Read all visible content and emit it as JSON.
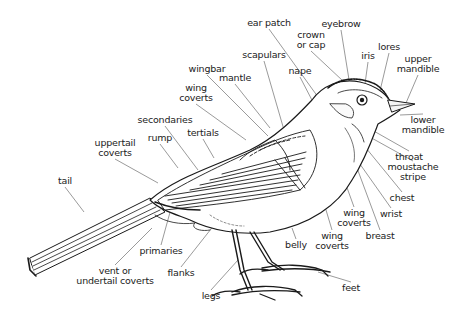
{
  "colors": {
    "ink": "#1a1a1a",
    "leader": "#555555",
    "background": "#ffffff"
  },
  "labels": [
    {
      "id": "ear_patch",
      "text": "ear patch",
      "x": 269,
      "y": 23,
      "lx": 318,
      "ly": 97
    },
    {
      "id": "eyebrow",
      "text": "eyebrow",
      "x": 341,
      "y": 24,
      "lx": 351,
      "ly": 92
    },
    {
      "id": "crown",
      "text": "crown\nor cap",
      "x": 311,
      "y": 40,
      "lx": 343,
      "ly": 81
    },
    {
      "id": "iris",
      "text": "iris",
      "x": 368,
      "y": 56,
      "lx": 364,
      "ly": 91
    },
    {
      "id": "lores",
      "text": "lores",
      "x": 389,
      "y": 47,
      "lx": 379,
      "ly": 95
    },
    {
      "id": "upper_mandible",
      "text": "upper\nmandible",
      "x": 418,
      "y": 64,
      "lx": 406,
      "ly": 103
    },
    {
      "id": "scapulars",
      "text": "scapulars",
      "x": 264,
      "y": 55,
      "lx": 284,
      "ly": 130
    },
    {
      "id": "nape",
      "text": "nape",
      "x": 300,
      "y": 71,
      "lx": 314,
      "ly": 104
    },
    {
      "id": "wingbar",
      "text": "wingbar",
      "x": 207,
      "y": 69,
      "lx": 268,
      "ly": 136
    },
    {
      "id": "mantle",
      "text": "mantle",
      "x": 235,
      "y": 78,
      "lx": 270,
      "ly": 128
    },
    {
      "id": "wing_coverts_upper",
      "text": "wing\ncoverts",
      "x": 196,
      "y": 93,
      "lx": 246,
      "ly": 140
    },
    {
      "id": "lower_mandible",
      "text": "lower\nmandible",
      "x": 423,
      "y": 125,
      "lx": 400,
      "ly": 115
    },
    {
      "id": "secondaries",
      "text": "secondaries",
      "x": 165,
      "y": 120,
      "lx": 198,
      "ly": 170
    },
    {
      "id": "tertials",
      "text": "tertials",
      "x": 203,
      "y": 133,
      "lx": 214,
      "ly": 158
    },
    {
      "id": "rump",
      "text": "rump",
      "x": 160,
      "y": 138,
      "lx": 178,
      "ly": 168
    },
    {
      "id": "uppertail_coverts",
      "text": "uppertail\ncoverts",
      "x": 115,
      "y": 148,
      "lx": 158,
      "ly": 183
    },
    {
      "id": "throat",
      "text": "throat",
      "x": 409,
      "y": 157,
      "lx": 372,
      "ly": 130
    },
    {
      "id": "moustache_stripe",
      "text": "moustache\nstripe",
      "x": 413,
      "y": 172,
      "lx": 368,
      "ly": 136
    },
    {
      "id": "tail",
      "text": "tail",
      "x": 65,
      "y": 181,
      "lx": 84,
      "ly": 212
    },
    {
      "id": "chest",
      "text": "chest",
      "x": 402,
      "y": 198,
      "lx": 366,
      "ly": 148
    },
    {
      "id": "wrist",
      "text": "wrist",
      "x": 391,
      "y": 214,
      "lx": 350,
      "ly": 150
    },
    {
      "id": "wing_coverts_mid",
      "text": "wing\ncoverts",
      "x": 354,
      "y": 218,
      "lx": 337,
      "ly": 160
    },
    {
      "id": "breast",
      "text": "breast",
      "x": 380,
      "y": 236,
      "lx": 357,
      "ly": 168
    },
    {
      "id": "wing_coverts_low",
      "text": "wing\ncoverts",
      "x": 332,
      "y": 241,
      "lx": 314,
      "ly": 170
    },
    {
      "id": "belly",
      "text": "belly",
      "x": 296,
      "y": 245,
      "lx": 292,
      "ly": 228
    },
    {
      "id": "primaries",
      "text": "primaries",
      "x": 161,
      "y": 251,
      "lx": 172,
      "ly": 205
    },
    {
      "id": "flanks",
      "text": "flanks",
      "x": 181,
      "y": 273,
      "lx": 226,
      "ly": 210
    },
    {
      "id": "vent",
      "text": "vent or\nundertail coverts",
      "x": 115,
      "y": 276,
      "lx": 152,
      "ly": 228
    },
    {
      "id": "feet",
      "text": "feet",
      "x": 351,
      "y": 288,
      "lx": 318,
      "ly": 272
    },
    {
      "id": "legs",
      "text": "legs",
      "x": 211,
      "y": 296,
      "lx": 238,
      "ly": 260
    }
  ]
}
